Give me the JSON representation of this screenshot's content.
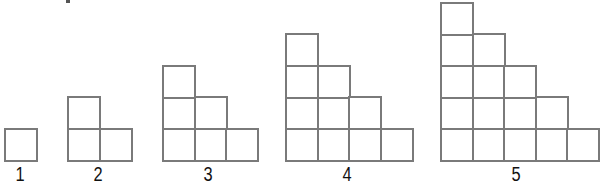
{
  "diagram": {
    "stroke_color": "#7a7a7a",
    "cell_size_px": 31.5,
    "baseline_y": 159,
    "figures": [
      {
        "label": "1",
        "steps": 1,
        "left": 4,
        "label_x": 20
      },
      {
        "label": "2",
        "steps": 2,
        "left": 67,
        "label_x": 98
      },
      {
        "label": "3",
        "steps": 3,
        "left": 162,
        "label_x": 208
      },
      {
        "label": "4",
        "steps": 4,
        "left": 285,
        "label_x": 347
      },
      {
        "label": "5",
        "steps": 5,
        "left": 440,
        "label_x": 516
      }
    ]
  }
}
